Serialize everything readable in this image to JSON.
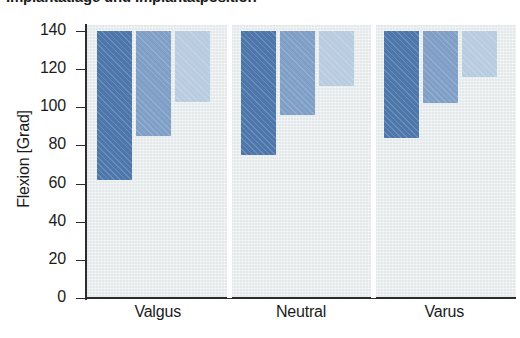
{
  "chart_data": {
    "type": "bar",
    "title": "Implantatlage und Implantatposition",
    "xlabel": "",
    "ylabel": "Flexion [Grad]",
    "ylim": [
      0,
      140
    ],
    "yticks": [
      0,
      20,
      40,
      60,
      80,
      100,
      120,
      140
    ],
    "ytick_labels": [
      "0",
      "20",
      "40",
      "60",
      "80",
      "100",
      "120",
      "140"
    ],
    "grid": false,
    "legend": "none",
    "bar_style": "floating-range-bars-from-top",
    "bar_top_value": 140,
    "categories": [
      "Valgus",
      "Neutral",
      "Varus"
    ],
    "series": [
      {
        "name": "Series 1",
        "color": "#4d77ab",
        "values": [
          62,
          75,
          84
        ]
      },
      {
        "name": "Series 2",
        "color": "#7f9fc6",
        "values": [
          85,
          96,
          102
        ]
      },
      {
        "name": "Series 3",
        "color": "#b8cce0",
        "values": [
          103,
          111,
          116
        ]
      }
    ],
    "colors": {
      "plot_background": "#e3e8ea",
      "axis": "#2c2c2c",
      "text": "#1b1b1b",
      "panel_separator": "#ffffff",
      "series_dark": "#4d77ab",
      "series_mid": "#7f9fc6",
      "series_light": "#b8cce0"
    }
  }
}
